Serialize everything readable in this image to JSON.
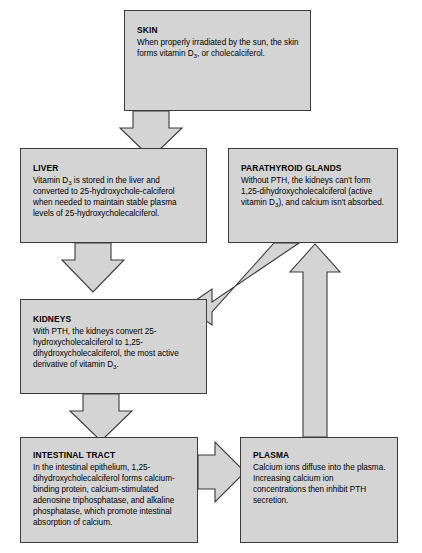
{
  "diagram": {
    "style": {
      "box_fill": "#d4d4d4",
      "box_border": "#3a3a3a",
      "arrow_fill": "#d4d4d4",
      "arrow_border": "#3a3a3a",
      "page_background": "#ffffff",
      "text_color": "#000000"
    },
    "nodes": [
      {
        "id": "skin",
        "title": "SKIN",
        "body_lines": [
          "When properly irradiated by the sun,",
          "the skin forms vitamin D",
          ", or",
          "cholecalciferol."
        ],
        "body_prefix": "When properly irradiated by the sun, the skin forms vitamin D",
        "body_sub": "3",
        "body_suffix": ", or cholecalciferol."
      },
      {
        "id": "liver",
        "title": "LIVER",
        "body_prefix": "Vitamin D",
        "body_sub": "3",
        "body_suffix": " is stored in the liver and converted to 25-hydroxychole-calciferol when needed to maintain stable plasma levels of 25-hydroxycholecalciferol."
      },
      {
        "id": "parathyroid",
        "title": "PARATHYROID GLANDS",
        "body_prefix": "Without PTH, the kidneys can't form 1,25-dihydroxycholecalciferol (active vitamin D",
        "body_sub": "3",
        "body_suffix": "), and calcium isn't absorbed."
      },
      {
        "id": "kidneys",
        "title": "KIDNEYS",
        "body_prefix": "With PTH, the kidneys convert 25-hydroxycholecalciferol to 1,25-dihydroxycholecalciferol, the most active derivative of vitamin D",
        "body_sub": "3",
        "body_suffix": "."
      },
      {
        "id": "intestinal",
        "title": "INTESTINAL TRACT",
        "body_prefix": "In the intestinal epithelium, 1,25-dihydroxycholecalciferol forms calcium-binding protein, calcium-stimulated adenosine triphosphatase, and alkaline phosphatase, which promote intestinal absorption of calcium.",
        "body_sub": "",
        "body_suffix": ""
      },
      {
        "id": "plasma",
        "title": "PLASMA",
        "body_prefix": "Calcium ions diffuse into the plasma. Increasing calcium ion concentrations then inhibit PTH secretion.",
        "body_sub": "",
        "body_suffix": ""
      }
    ],
    "arrows": [
      {
        "id": "skin-to-liver",
        "from": "skin",
        "to": "liver",
        "direction": "down"
      },
      {
        "id": "liver-to-kidneys",
        "from": "liver",
        "to": "kidneys",
        "direction": "down"
      },
      {
        "id": "parathyroid-to-kidneys",
        "from": "parathyroid",
        "to": "kidneys",
        "direction": "down-left"
      },
      {
        "id": "kidneys-to-intestinal",
        "from": "kidneys",
        "to": "intestinal",
        "direction": "down"
      },
      {
        "id": "intestinal-to-plasma",
        "from": "intestinal",
        "to": "plasma",
        "direction": "right"
      },
      {
        "id": "plasma-to-parathyroid",
        "from": "plasma",
        "to": "parathyroid",
        "direction": "up"
      }
    ]
  }
}
